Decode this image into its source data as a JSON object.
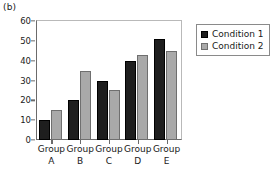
{
  "panel": {
    "label": "(b)"
  },
  "chart_data": {
    "type": "bar",
    "title": "",
    "xlabel": "",
    "ylabel": "",
    "ylim": [
      0,
      60
    ],
    "yticks": [
      0,
      10,
      20,
      30,
      40,
      50,
      60
    ],
    "ytick_labels": [
      "0",
      "10",
      "20",
      "30",
      "40",
      "50",
      "60"
    ],
    "grid": false,
    "legend_position": "outside-top-right",
    "categories": [
      "Group A",
      "Group B",
      "Group C",
      "Group D",
      "Group E"
    ],
    "category_lines": [
      {
        "line1": "Group",
        "line2": "A"
      },
      {
        "line1": "Group",
        "line2": "B"
      },
      {
        "line1": "Group",
        "line2": "C"
      },
      {
        "line1": "Group",
        "line2": "D"
      },
      {
        "line1": "Group",
        "line2": "E"
      }
    ],
    "series": [
      {
        "name": "Condition 1",
        "color": "#1e1e1e",
        "values": [
          10,
          20,
          30,
          40,
          51
        ]
      },
      {
        "name": "Condition 2",
        "color": "#a9a9a9",
        "values": [
          15,
          35,
          25,
          43,
          45
        ]
      }
    ]
  },
  "legend": {
    "items": [
      {
        "label": "Condition 1",
        "swatch": "black-square-swatch"
      },
      {
        "label": "Condition 2",
        "swatch": "gray-square-swatch"
      }
    ]
  }
}
